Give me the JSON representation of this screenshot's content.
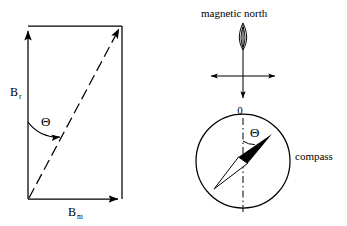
{
  "figure": {
    "background_color": "#ffffff",
    "ink_color": "#000000",
    "left_panel": {
      "name": "vector-parallelogram",
      "labels": {
        "vertical_vector_base": "B",
        "vertical_vector_sub": "r",
        "horizontal_vector_base": "B",
        "horizontal_vector_sub": "m",
        "angle": "Θ"
      },
      "geometry": {
        "rect_left": 28,
        "rect_right": 122,
        "rect_top": 26,
        "rect_bottom": 199,
        "diagonal": "bottom-left to top-right",
        "diagonal_style": "dashed",
        "arc_start_deg": 0,
        "arc_sweep": "counterclockwise toward diagonal"
      }
    },
    "right_panel": {
      "name": "compass-deflection",
      "labels": {
        "north": "magnetic north",
        "origin": "0",
        "angle": "Θ",
        "device": "compass"
      },
      "geometry": {
        "axis_x": 243,
        "cross_y": 76,
        "circle_cx": 243,
        "circle_cy": 161,
        "circle_r": 47,
        "needle_angle_deg": 35,
        "needle_dash_axis": "dash-dot vertical"
      }
    }
  }
}
